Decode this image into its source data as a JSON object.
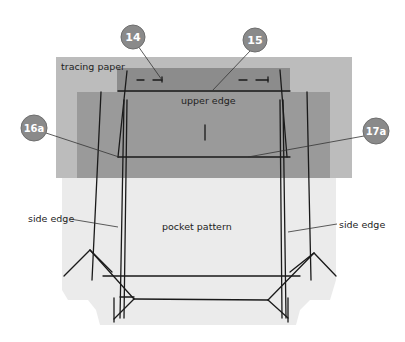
{
  "labels": {
    "tracing_paper": "tracing paper",
    "upper_edge": "upper edge",
    "pocket_pattern": "pocket pattern",
    "side_edge_left": "side edge",
    "side_edge_right": "side edge"
  },
  "callouts": [
    {
      "id": "14",
      "label": "14"
    },
    {
      "id": "15",
      "label": "15"
    },
    {
      "id": "16a",
      "label": "16a"
    },
    {
      "id": "17a",
      "label": "17a"
    }
  ],
  "colors": {
    "tracing_paper": "#bcbcbc",
    "inner_upper": "#8c8c8c",
    "inner_lower": "#999999",
    "pocket_pattern": "#ebebeb",
    "callout_fill": "#8a8a8a",
    "callout_stroke": "#6e6e6e",
    "line": "#1a1a1a"
  }
}
